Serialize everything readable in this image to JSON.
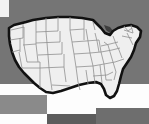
{
  "canvas": {
    "width": 149,
    "height": 124
  },
  "colors": {
    "background_gray": "#757575",
    "background_white": "#fdfdfd",
    "panel_gray_left": "#8a8a8a",
    "panel_gray_right": "#6e6e6e",
    "bottom_bar_dark": "#5c5c5c",
    "corner_white": "#f2f2f2",
    "state_fill": "#efefef",
    "state_border": "#8f8f8f",
    "coast_outline": "#111111",
    "water_dark": "#4a4a4a"
  },
  "map": {
    "title": "United States",
    "subtitle": "Contiguous 48 states",
    "projection": "albers-usa",
    "outline_label": "national-boundary",
    "interior_label": "state-boundaries",
    "water_label": "great-lakes",
    "region_count": 48
  },
  "chrome": {
    "faint_text": "",
    "corner_marker_label": "window-corner",
    "left_panel_label": "left-panel",
    "right_panel_label": "right-panel",
    "bottom_bar_label": "bottom-bar"
  }
}
